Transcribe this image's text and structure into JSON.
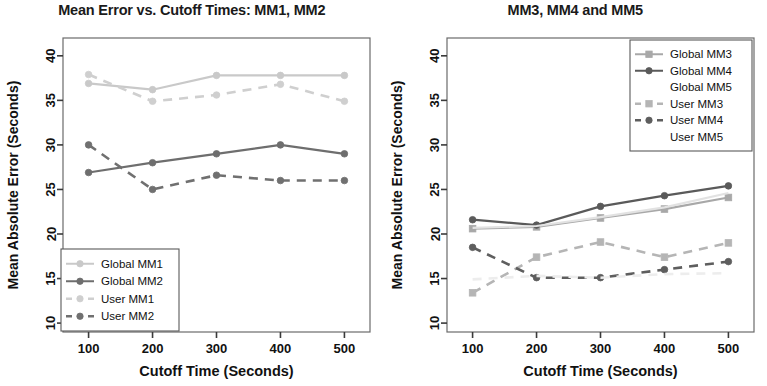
{
  "figure": {
    "width": 767,
    "height": 386,
    "background": "#ffffff"
  },
  "panels": [
    {
      "id": "left",
      "title": "Mean Error vs. Cutoff Times: MM1, MM2",
      "xlabel": "Cutoff Time (Seconds)",
      "ylabel": "Mean Absolute Error (Seconds)",
      "legend_position": "bottom-left"
    },
    {
      "id": "right",
      "title": "MM3, MM4 and MM5",
      "xlabel": "Cutoff Time (Seconds)",
      "ylabel": "Mean Absolute Error (Seconds)",
      "legend_position": "top-right"
    }
  ],
  "chart_data": [
    {
      "type": "line",
      "title": "Mean Error vs. Cutoff Times: MM1, MM2",
      "xlabel": "Cutoff Time (Seconds)",
      "ylabel": "Mean Absolute Error (Seconds)",
      "categories": [
        100,
        200,
        300,
        400,
        500
      ],
      "xticks": [
        100,
        200,
        300,
        400,
        500
      ],
      "yticks": [
        10,
        15,
        20,
        25,
        30,
        35,
        40
      ],
      "xlim": [
        60,
        540
      ],
      "ylim": [
        9,
        42
      ],
      "grid": false,
      "legend": [
        "Global MM1",
        "Global MM2",
        "User MM1",
        "User MM2"
      ],
      "series": [
        {
          "name": "Global MM1",
          "values": [
            36.9,
            36.2,
            37.8,
            37.8,
            37.8
          ],
          "color": "#c9c9c9",
          "dash": "solid",
          "marker": "circle"
        },
        {
          "name": "Global MM2",
          "values": [
            26.9,
            28.0,
            29.0,
            30.0,
            29.0
          ],
          "color": "#6e6e6e",
          "dash": "solid",
          "marker": "circle"
        },
        {
          "name": "User MM1",
          "values": [
            37.9,
            34.9,
            35.6,
            36.8,
            34.9
          ],
          "color": "#cfcfcf",
          "dash": "dashed",
          "marker": "circle"
        },
        {
          "name": "User MM2",
          "values": [
            30.0,
            25.0,
            26.6,
            26.0,
            26.0
          ],
          "color": "#707070",
          "dash": "dashed",
          "marker": "circle"
        }
      ]
    },
    {
      "type": "line",
      "title": "MM3, MM4 and MM5",
      "xlabel": "Cutoff Time (Seconds)",
      "ylabel": "Mean Absolute Error (Seconds)",
      "categories": [
        100,
        200,
        300,
        400,
        500
      ],
      "xticks": [
        100,
        200,
        300,
        400,
        500
      ],
      "yticks": [
        10,
        15,
        20,
        25,
        30,
        35,
        40
      ],
      "xlim": [
        60,
        540
      ],
      "ylim": [
        9,
        42
      ],
      "grid": false,
      "legend": [
        "Global MM3",
        "Global MM4",
        "Global MM5",
        "User MM3",
        "User MM4",
        "User MM5"
      ],
      "series": [
        {
          "name": "Global MM3",
          "values": [
            20.6,
            20.8,
            21.8,
            22.8,
            24.1
          ],
          "color": "#a8a8a8",
          "dash": "solid",
          "marker": "square"
        },
        {
          "name": "Global MM4",
          "values": [
            21.6,
            21.0,
            23.1,
            24.3,
            25.4
          ],
          "color": "#5a5a5a",
          "dash": "solid",
          "marker": "circle"
        },
        {
          "name": "Global MM5",
          "values": [
            20.7,
            20.9,
            21.9,
            23.0,
            24.6
          ],
          "color": "#e2e2e2",
          "dash": "solid",
          "marker": "none"
        },
        {
          "name": "User MM3",
          "values": [
            13.4,
            17.4,
            19.1,
            17.4,
            19.0
          ],
          "color": "#b5b5b5",
          "dash": "dashed",
          "marker": "square"
        },
        {
          "name": "User MM4",
          "values": [
            18.5,
            15.1,
            15.1,
            16.0,
            16.9
          ],
          "color": "#5e5e5e",
          "dash": "dashed",
          "marker": "circle"
        },
        {
          "name": "User MM5",
          "values": [
            14.9,
            15.3,
            15.1,
            15.5,
            15.6
          ],
          "color": "#ededed",
          "dash": "dashed",
          "marker": "none"
        }
      ]
    }
  ]
}
